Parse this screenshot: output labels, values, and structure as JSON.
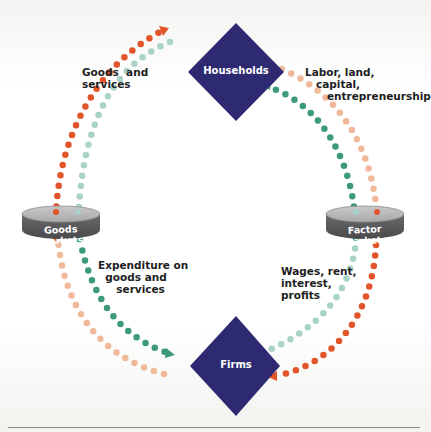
{
  "diagram": {
    "nodes": {
      "households": {
        "label": "Households",
        "color": "#2e2a72"
      },
      "firms": {
        "label": "Firms",
        "color": "#2e2a72"
      },
      "goods_markets": {
        "label": "Goods markets",
        "color": "#57575a"
      },
      "factor_markets": {
        "label": "Factor markets",
        "color": "#57575a"
      }
    },
    "flows": [
      {
        "id": "goods-services",
        "from": "Goods markets",
        "to": "Households",
        "label": "Goods  and\nservices",
        "color": "#e2542a"
      },
      {
        "id": "expenditure",
        "from": "Households",
        "to": "Goods markets",
        "label": "",
        "color": "#a9d3c8"
      },
      {
        "id": "expenditure-to-firms",
        "from": "Goods markets",
        "to": "Firms",
        "label": "Expenditure on\n  goods and\n     services",
        "color": "#3c9a7a"
      },
      {
        "id": "goods-from-firms",
        "from": "Firms",
        "to": "Goods markets",
        "label": "",
        "color": "#f0b99a"
      },
      {
        "id": "factors",
        "from": "Households",
        "to": "Factor markets",
        "label": "Labor, land,\n   capital,\n      entrepreneurship",
        "color": "#f0b99a"
      },
      {
        "id": "income",
        "from": "Factor markets",
        "to": "Households",
        "label": "",
        "color": "#3c9a7a"
      },
      {
        "id": "wages",
        "from": "Firms",
        "to": "Factor markets",
        "label": "Wages, rent,\ninterest,\nprofits",
        "color": "#a9d3c8"
      },
      {
        "id": "factors-to-firms",
        "from": "Factor markets",
        "to": "Firms",
        "label": "",
        "color": "#e2542a"
      }
    ]
  }
}
